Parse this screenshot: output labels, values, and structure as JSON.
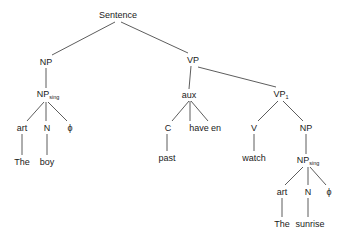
{
  "diagram": {
    "type": "syntax-tree",
    "nodes": {
      "sentence": {
        "label": "Sentence"
      },
      "np_subj": {
        "label": "NP"
      },
      "np_sing_subj": {
        "label": "NP",
        "sub": "sing"
      },
      "art_subj": {
        "label": "art"
      },
      "n_subj": {
        "label": "N"
      },
      "phi_subj": {
        "label": "ϕ"
      },
      "the_subj": {
        "label": "The"
      },
      "boy": {
        "label": "boy"
      },
      "vp": {
        "label": "VP"
      },
      "aux": {
        "label": "aux"
      },
      "c": {
        "label": "C"
      },
      "have": {
        "label": "have"
      },
      "en": {
        "label": "en"
      },
      "past": {
        "label": "past"
      },
      "vp1": {
        "label": "VP",
        "sub": "1"
      },
      "v": {
        "label": "V"
      },
      "watch": {
        "label": "watch"
      },
      "np_obj": {
        "label": "NP"
      },
      "np_sing_obj": {
        "label": "NP",
        "sub": "sing"
      },
      "art_obj": {
        "label": "art"
      },
      "n_obj": {
        "label": "N"
      },
      "phi_obj": {
        "label": "ϕ"
      },
      "the_obj": {
        "label": "The"
      },
      "sunrise": {
        "label": "sunrise"
      }
    },
    "edges": [
      [
        "sentence",
        "np_subj"
      ],
      [
        "sentence",
        "vp"
      ],
      [
        "np_subj",
        "np_sing_subj"
      ],
      [
        "np_sing_subj",
        "art_subj"
      ],
      [
        "np_sing_subj",
        "n_subj"
      ],
      [
        "np_sing_subj",
        "phi_subj"
      ],
      [
        "art_subj",
        "the_subj"
      ],
      [
        "n_subj",
        "boy"
      ],
      [
        "vp",
        "aux"
      ],
      [
        "vp",
        "vp1"
      ],
      [
        "aux",
        "c"
      ],
      [
        "aux",
        "have"
      ],
      [
        "aux",
        "en"
      ],
      [
        "c",
        "past"
      ],
      [
        "vp1",
        "v"
      ],
      [
        "vp1",
        "np_obj"
      ],
      [
        "v",
        "watch"
      ],
      [
        "np_obj",
        "np_sing_obj"
      ],
      [
        "np_sing_obj",
        "art_obj"
      ],
      [
        "np_sing_obj",
        "n_obj"
      ],
      [
        "np_sing_obj",
        "phi_obj"
      ],
      [
        "art_obj",
        "the_obj"
      ],
      [
        "n_obj",
        "sunrise"
      ]
    ]
  }
}
